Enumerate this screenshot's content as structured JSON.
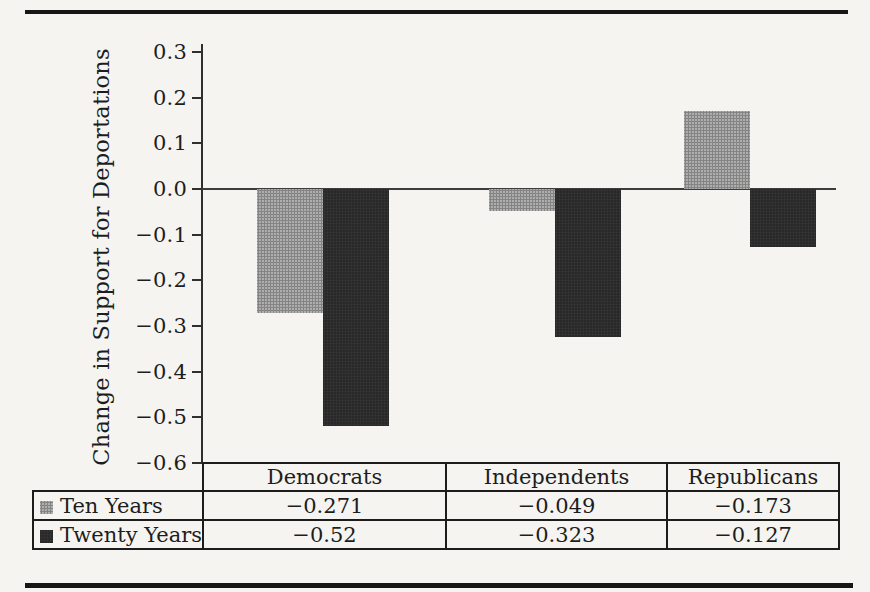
{
  "figure": {
    "background": "#f5f4f1",
    "rule_color": "#161616"
  },
  "chart_data": {
    "type": "bar",
    "title": "",
    "xlabel": "",
    "ylabel": "Change in Support for Deportations",
    "categories": [
      "Democrats",
      "Independents",
      "Republicans"
    ],
    "series": [
      {
        "name": "Ten Years",
        "color": "#aeaeae",
        "style": "halftone-gray",
        "values": [
          -0.271,
          -0.049,
          -0.173
        ],
        "display_values": [
          "−0.271",
          "−0.049",
          "−0.173"
        ],
        "drawn_values": [
          -0.271,
          -0.049,
          0.17
        ]
      },
      {
        "name": "Twenty Years",
        "color": "#292929",
        "style": "solid-dark",
        "values": [
          -0.52,
          -0.323,
          -0.127
        ],
        "display_values": [
          "−0.52",
          "−0.323",
          "−0.127"
        ],
        "drawn_values": [
          -0.52,
          -0.323,
          -0.127
        ]
      }
    ],
    "ylim": [
      -0.6,
      0.3
    ],
    "ytick_step": 0.1,
    "ytick_labels": [
      "0.3",
      "0.2",
      "0.1",
      "0.0",
      "−0.1",
      "−0.2",
      "−0.3",
      "−0.4",
      "−0.5",
      "−0.6"
    ],
    "grid": false,
    "baseline": 0,
    "legend_position": "data-table-left-column",
    "data_table_attached": true,
    "column_fractions": [
      0.383,
      0.347,
      0.27
    ]
  }
}
